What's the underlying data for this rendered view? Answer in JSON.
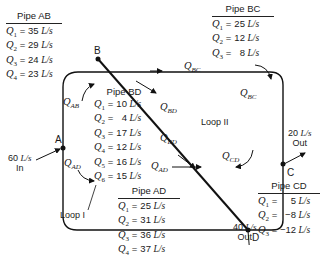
{
  "nodes": {
    "A": "A",
    "B": "B",
    "C": "C",
    "D": "D"
  },
  "flows": {
    "inflow_A": {
      "value": "60",
      "unit": "L/s",
      "dir": "In"
    },
    "outflow_C": {
      "value": "20",
      "unit": "L/s",
      "dir": "Out"
    },
    "outflow_D": {
      "value": "40",
      "unit": "L/s",
      "dir": "Out"
    }
  },
  "loops": {
    "loop1": "Loop I",
    "loop2": "Loop II"
  },
  "pipe_labels": {
    "q_ab": {
      "q": "Q",
      "sub": "AB"
    },
    "q_bc_top": {
      "q": "Q",
      "sub": "BC"
    },
    "q_bc_right": {
      "q": "Q",
      "sub": "BC"
    },
    "q_bd_upper": {
      "q": "Q",
      "sub": "BD"
    },
    "q_bd_lower": {
      "q": "Q",
      "sub": "BD"
    },
    "q_ad_left": {
      "q": "Q",
      "sub": "AD"
    },
    "q_ad_bottom": {
      "q": "Q",
      "sub": "AD"
    },
    "q_cd": {
      "q": "Q",
      "sub": "CD"
    }
  },
  "tables": {
    "pipe_ab": {
      "title": "Pipe AB",
      "rows": [
        {
          "q": "Q",
          "sub": "1",
          "value": "35",
          "unit": "L/s"
        },
        {
          "q": "Q",
          "sub": "2",
          "value": "29",
          "unit": "L/s"
        },
        {
          "q": "Q",
          "sub": "3",
          "value": "24",
          "unit": "L/s"
        },
        {
          "q": "Q",
          "sub": "4",
          "value": "23",
          "unit": "L/s"
        }
      ]
    },
    "pipe_bc": {
      "title": "Pipe BC",
      "rows": [
        {
          "q": "Q",
          "sub": "1",
          "value": "25",
          "unit": "L/s"
        },
        {
          "q": "Q",
          "sub": "2",
          "value": "12",
          "unit": "L/s"
        },
        {
          "q": "Q",
          "sub": "3",
          "value": "8",
          "unit": "L/s"
        }
      ]
    },
    "pipe_bd": {
      "title": "Pipe BD",
      "rows": [
        {
          "q": "Q",
          "sub": "1",
          "value": "10",
          "unit": "L/s"
        },
        {
          "q": "Q",
          "sub": "2",
          "value": "4",
          "unit": "L/s"
        },
        {
          "q": "Q",
          "sub": "3",
          "value": "17",
          "unit": "L/s"
        },
        {
          "q": "Q",
          "sub": "4",
          "value": "12",
          "unit": "L/s"
        },
        {
          "q": "Q",
          "sub": "5",
          "value": "16",
          "unit": "L/s"
        },
        {
          "q": "Q",
          "sub": "6",
          "value": "15",
          "unit": "L/s"
        }
      ]
    },
    "pipe_ad": {
      "title": "Pipe AD",
      "rows": [
        {
          "q": "Q",
          "sub": "1",
          "value": "25",
          "unit": "L/s"
        },
        {
          "q": "Q",
          "sub": "2",
          "value": "31",
          "unit": "L/s"
        },
        {
          "q": "Q",
          "sub": "3",
          "value": "36",
          "unit": "L/s"
        },
        {
          "q": "Q",
          "sub": "4",
          "value": "37",
          "unit": "L/s"
        }
      ]
    },
    "pipe_cd": {
      "title": "Pipe CD",
      "rows": [
        {
          "q": "Q",
          "sub": "1",
          "value": "5",
          "unit": "L/s"
        },
        {
          "q": "Q",
          "sub": "2",
          "value": "−8",
          "unit": "L/s"
        },
        {
          "q": "Q",
          "sub": "3",
          "value": "−12",
          "unit": "L/s"
        }
      ]
    }
  }
}
